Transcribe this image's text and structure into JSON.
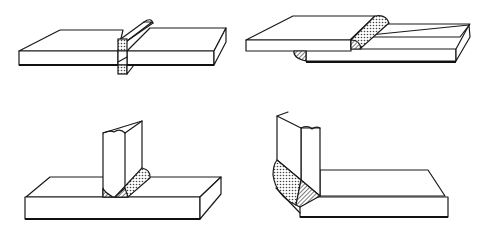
{
  "figure": {
    "panels": [
      {
        "id": "butt-joint",
        "position": "top-left",
        "weld": "square groove weld through two plates"
      },
      {
        "id": "lap-joint",
        "position": "top-right",
        "weld": "fillet welds on overlapping plates"
      },
      {
        "id": "tee-joint",
        "position": "bottom-left",
        "weld": "double fillet weld at T-junction"
      },
      {
        "id": "corner-joint",
        "position": "bottom-right",
        "weld": "corner weld with fillet"
      }
    ],
    "colors": {
      "line": "#1a1a1a",
      "background": "#ffffff",
      "weld_fill": "#b0b0b0"
    }
  }
}
